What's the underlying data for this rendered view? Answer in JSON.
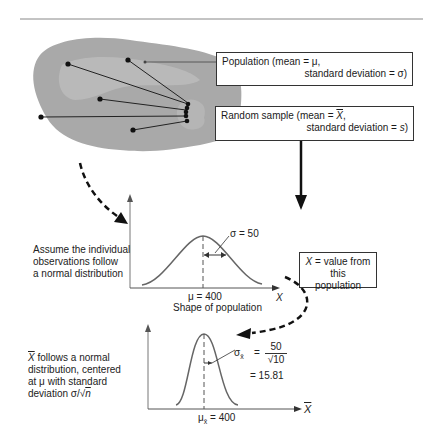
{
  "population_box": {
    "line1": "Population  (mean = μ,",
    "line2": "standard deviation = σ)"
  },
  "sample_box": {
    "line1_prefix": "Random sample (mean = ",
    "line1_symbol": "X",
    "line1_suffix": ",",
    "line2_prefix": "standard deviation = ",
    "line2_symbol": "s",
    "line2_suffix": ")"
  },
  "assumption_note": {
    "line1": "Assume the individual",
    "line2": "observations follow",
    "line3": "a normal distribution"
  },
  "population_curve": {
    "sigma_label": "σ = 50",
    "mean_label": "μ = 400",
    "caption": "Shape of population",
    "axis_label": "X"
  },
  "x_definition_box": {
    "line1_symbol": "X",
    "line1_text": " = value from this",
    "line2": "population"
  },
  "sampling_note": {
    "symbol": "X",
    "line1": " follows a normal",
    "line2": "distribution, centered",
    "line3": "at μ with standard",
    "line4_prefix": "deviation σ/√",
    "line4_symbol": "n"
  },
  "sampling_curve": {
    "sigma_symbol": "σ",
    "sigma_sub": "x̄",
    "numerator": "50",
    "denominator": "√10",
    "result": "= 15.81",
    "equals": "=",
    "mean_symbol": "μ",
    "mean_sub": "x̄",
    "mean_value": "= 400",
    "axis_label": "X"
  },
  "colors": {
    "population_fill": "#a9a9a9",
    "population_highlight": "#c4c4c4",
    "sample_fill": "#b5b5b5",
    "curve": "#555555",
    "arrow": "#111111"
  }
}
